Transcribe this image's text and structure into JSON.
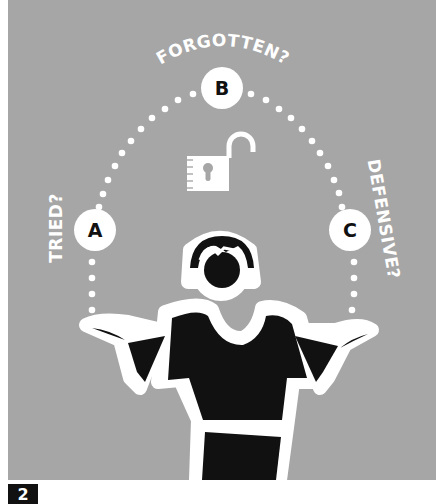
{
  "illustration": {
    "background_color": "#a6a6a6",
    "labels": {
      "forgotten": "FORGOTTEN?",
      "tried": "TRIED?",
      "defensive": "DEFENSIVE?"
    },
    "balls": [
      {
        "id": "a",
        "letter": "A"
      },
      {
        "id": "b",
        "letter": "B"
      },
      {
        "id": "c",
        "letter": "C"
      }
    ],
    "center_icon": "unlocked-padlock-icon",
    "figure": "person-juggling-shrugging"
  },
  "step_badge": {
    "number": "2"
  }
}
